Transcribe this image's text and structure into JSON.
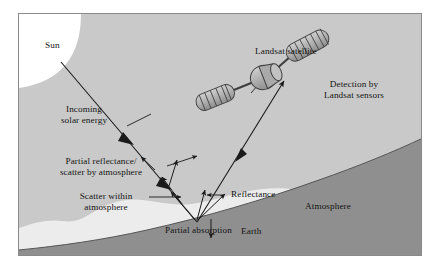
{
  "figure": {
    "background_color": "#c9c9c9",
    "border_color": "#8a8a8a",
    "atmosphere_color": "#ececec",
    "earth_color": "#8f8f8f",
    "sun_color": "#ffffff",
    "satellite_body_color": "#b3b3b3",
    "line_color": "#1a1a1a"
  },
  "labels": {
    "sun": "Sun",
    "incoming_line1": "Incoming",
    "incoming_line2": "solar energy",
    "partial_reflectance_line1": "Partial reflectance/",
    "partial_reflectance_line2": "scatter by atmosphere",
    "scatter_within_line1": "Scatter within",
    "scatter_within_line2": "atmosphere",
    "partial_absorption": "Partial absorption",
    "reflectance": "Reflectance",
    "atmosphere": "Atmosphere",
    "earth": "Earth",
    "landsat_satellite": "Landsat satellite",
    "detection_line1": "Detection by",
    "detection_line2": "Landsat sensors"
  },
  "elements": {
    "sun_name": "sun-body",
    "earth_name": "earth-surface",
    "atmosphere_name": "atmosphere-band",
    "satellite_name": "landsat-satellite-icon",
    "incoming_ray_name": "incoming-solar-ray",
    "reflected_ray_name": "reflected-ray-to-satellite",
    "scatter_rays_name": "atmospheric-scatter-rays",
    "absorption_arrow_name": "partial-absorption-arrow"
  }
}
